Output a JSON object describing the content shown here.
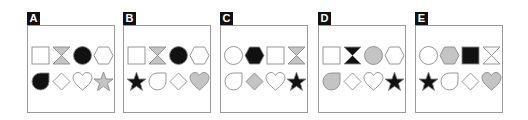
{
  "colors": {
    "white": "#ffffff",
    "gray": "#c4c4c4",
    "black": "#111111",
    "stroke": "#8a8a8a"
  },
  "panels": [
    {
      "label": "A",
      "left": 27,
      "rows": [
        [
          {
            "shape": "square",
            "fill": "white"
          },
          {
            "shape": "hourglass",
            "fill": "gray"
          },
          {
            "shape": "circle",
            "fill": "black"
          },
          {
            "shape": "hexagon",
            "fill": "white"
          }
        ],
        [
          {
            "shape": "teardrop",
            "fill": "black"
          },
          {
            "shape": "diamond",
            "fill": "white"
          },
          {
            "shape": "heart",
            "fill": "white"
          },
          {
            "shape": "star",
            "fill": "gray"
          }
        ]
      ]
    },
    {
      "label": "B",
      "left": 123,
      "rows": [
        [
          {
            "shape": "square",
            "fill": "white"
          },
          {
            "shape": "hourglass",
            "fill": "gray"
          },
          {
            "shape": "circle",
            "fill": "black"
          },
          {
            "shape": "hexagon",
            "fill": "white"
          }
        ],
        [
          {
            "shape": "star",
            "fill": "black"
          },
          {
            "shape": "teardrop",
            "fill": "white"
          },
          {
            "shape": "diamond",
            "fill": "white"
          },
          {
            "shape": "heart",
            "fill": "gray"
          }
        ]
      ]
    },
    {
      "label": "C",
      "left": 220,
      "rows": [
        [
          {
            "shape": "circle",
            "fill": "white"
          },
          {
            "shape": "hexagon",
            "fill": "black"
          },
          {
            "shape": "square",
            "fill": "white"
          },
          {
            "shape": "hourglass",
            "fill": "gray"
          }
        ],
        [
          {
            "shape": "teardrop",
            "fill": "white"
          },
          {
            "shape": "diamond",
            "fill": "gray"
          },
          {
            "shape": "heart",
            "fill": "white"
          },
          {
            "shape": "star",
            "fill": "black"
          }
        ]
      ]
    },
    {
      "label": "D",
      "left": 318,
      "rows": [
        [
          {
            "shape": "square",
            "fill": "white"
          },
          {
            "shape": "hourglass",
            "fill": "black"
          },
          {
            "shape": "circle",
            "fill": "gray"
          },
          {
            "shape": "hexagon",
            "fill": "white"
          }
        ],
        [
          {
            "shape": "teardrop",
            "fill": "gray"
          },
          {
            "shape": "diamond",
            "fill": "white"
          },
          {
            "shape": "heart",
            "fill": "white"
          },
          {
            "shape": "star",
            "fill": "black"
          }
        ]
      ]
    },
    {
      "label": "E",
      "left": 415,
      "rows": [
        [
          {
            "shape": "circle",
            "fill": "white"
          },
          {
            "shape": "hexagon",
            "fill": "gray"
          },
          {
            "shape": "square",
            "fill": "black"
          },
          {
            "shape": "hourglass",
            "fill": "white"
          }
        ],
        [
          {
            "shape": "star",
            "fill": "black"
          },
          {
            "shape": "teardrop",
            "fill": "white"
          },
          {
            "shape": "diamond",
            "fill": "white"
          },
          {
            "shape": "heart",
            "fill": "gray"
          }
        ]
      ]
    }
  ]
}
